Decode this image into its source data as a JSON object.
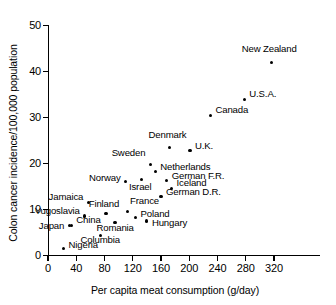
{
  "chart_data": {
    "type": "scatter",
    "title": "",
    "xlabel": "Per capita meat consumption (g/day)",
    "ylabel": "Colon cancer incidence/100,000 population",
    "xlim": [
      0,
      340
    ],
    "ylim": [
      0,
      50
    ],
    "xticks": [
      0,
      40,
      80,
      120,
      160,
      200,
      240,
      280,
      320
    ],
    "yticks": [
      0,
      10,
      20,
      30,
      40,
      50
    ],
    "grid": false,
    "legend": "none",
    "series": [
      {
        "name": "countries",
        "points": [
          {
            "label": "New Zealand",
            "x": 316,
            "y": 42.0
          },
          {
            "label": "U.S.A.",
            "x": 278,
            "y": 34.0
          },
          {
            "label": "Canada",
            "x": 230,
            "y": 30.5
          },
          {
            "label": "Denmark",
            "x": 172,
            "y": 23.5
          },
          {
            "label": "U.K.",
            "x": 201,
            "y": 22.8
          },
          {
            "label": "Sweden",
            "x": 145,
            "y": 19.8
          },
          {
            "label": "Netherlands",
            "x": 152,
            "y": 18.2
          },
          {
            "label": "German F.R.",
            "x": 168,
            "y": 16.3
          },
          {
            "label": "Israel",
            "x": 132,
            "y": 16.5
          },
          {
            "label": "Norway",
            "x": 110,
            "y": 16.0
          },
          {
            "label": "Iceland",
            "x": 175,
            "y": 14.6
          },
          {
            "label": "German D.R.",
            "x": 160,
            "y": 12.9
          },
          {
            "label": "Jamaica",
            "x": 57,
            "y": 11.6
          },
          {
            "label": "France",
            "x": 112,
            "y": 9.6
          },
          {
            "label": "Finland",
            "x": 82,
            "y": 9.1
          },
          {
            "label": "Yugoslavia",
            "x": 52,
            "y": 8.6
          },
          {
            "label": "Poland",
            "x": 124,
            "y": 8.2
          },
          {
            "label": "Hungary",
            "x": 140,
            "y": 7.5
          },
          {
            "label": "Romania",
            "x": 95,
            "y": 7.2
          },
          {
            "label": "China",
            "x": 33,
            "y": 6.6
          },
          {
            "label": "Columbia",
            "x": 74,
            "y": 4.4
          },
          {
            "label": "Japan",
            "x": 30,
            "y": 6.6
          },
          {
            "label": "Nigeria",
            "x": 22,
            "y": 1.5
          }
        ]
      }
    ]
  },
  "axes": {
    "y_title": "Colon cancer incidence/100,000 population",
    "x_title": "Per capita meat consumption (g/day)",
    "y_ticklabels": [
      "0",
      "10",
      "20",
      "30",
      "40",
      "50"
    ],
    "x_ticklabels": [
      "0",
      "40",
      "80",
      "120",
      "160",
      "200",
      "240",
      "280",
      "320"
    ]
  },
  "point_labels": {
    "new_zealand": "New Zealand",
    "usa": "U.S.A.",
    "canada": "Canada",
    "denmark": "Denmark",
    "uk": "U.K.",
    "sweden": "Sweden",
    "netherlands": "Netherlands",
    "german_fr": "German F.R.",
    "israel": "Israel",
    "norway": "Norway",
    "iceland": "Iceland",
    "german_dr": "German D.R.",
    "jamaica": "Jamaica",
    "france": "France",
    "finland": "Finland",
    "yugoslavia": "Yugoslavia",
    "poland": "Poland",
    "hungary": "Hungary",
    "romania": "Romania",
    "china": "China",
    "columbia": "Columbia",
    "japan": "Japan",
    "nigeria": "Nigeria"
  },
  "colors": {
    "marker": "#000000",
    "axis": "#000000",
    "background": "#ffffff"
  }
}
